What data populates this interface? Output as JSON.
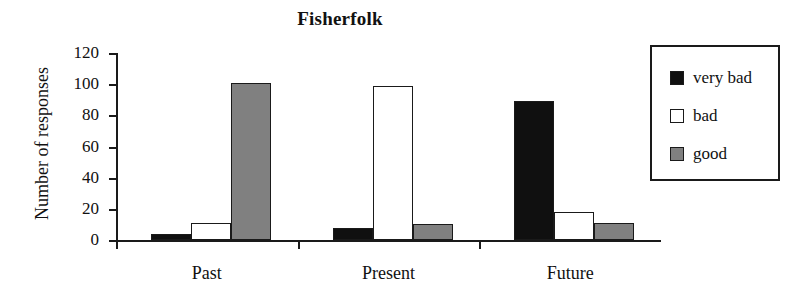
{
  "chart_data": {
    "type": "bar",
    "title": "Fisherfolk",
    "xlabel": "",
    "ylabel": "Number of responses",
    "categories": [
      "Past",
      "Present",
      "Future"
    ],
    "series": [
      {
        "name": "very bad",
        "color": "#101010",
        "values": [
          4,
          8,
          89
        ]
      },
      {
        "name": "bad",
        "color": "#ffffff",
        "values": [
          11,
          99,
          18
        ]
      },
      {
        "name": "good",
        "color": "#808080",
        "values": [
          101,
          10,
          11
        ]
      }
    ],
    "ylim": [
      0,
      120
    ],
    "y_ticks": [
      0,
      20,
      40,
      60,
      80,
      100,
      120
    ],
    "y_tick_labels": [
      "0",
      "20",
      "40",
      "60",
      "80",
      "100",
      "120"
    ],
    "grid": false,
    "legend_position": "right"
  },
  "legend": {
    "items": [
      {
        "label": "very bad"
      },
      {
        "label": "bad"
      },
      {
        "label": "good"
      }
    ]
  }
}
